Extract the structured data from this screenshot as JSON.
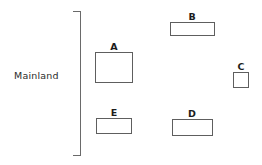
{
  "diagram": {
    "mainland": {
      "label": "Mainland",
      "label_x": 14,
      "label_y": 70,
      "bracket": {
        "x": 80,
        "y": 11,
        "height": 145
      }
    },
    "parcels": [
      {
        "id": "parcel-a",
        "label": "A",
        "x": 95,
        "y": 52,
        "width": 38,
        "height": 31,
        "label_x": 114,
        "label_y": 41
      },
      {
        "id": "parcel-b",
        "label": "B",
        "x": 170,
        "y": 22,
        "width": 45,
        "height": 14,
        "label_x": 192,
        "label_y": 11
      },
      {
        "id": "parcel-c",
        "label": "C",
        "x": 233,
        "y": 72,
        "width": 16,
        "height": 16,
        "label_x": 241,
        "label_y": 61
      },
      {
        "id": "parcel-d",
        "label": "D",
        "x": 172,
        "y": 119,
        "width": 41,
        "height": 17,
        "label_x": 192,
        "label_y": 108
      },
      {
        "id": "parcel-e",
        "label": "E",
        "x": 96,
        "y": 118,
        "width": 36,
        "height": 16,
        "label_x": 114,
        "label_y": 107
      }
    ],
    "colors": {
      "border": "#5e5e5e",
      "bracket": "#6a6a6a",
      "text": "#1c1c1c",
      "background": "#ffffff"
    }
  }
}
